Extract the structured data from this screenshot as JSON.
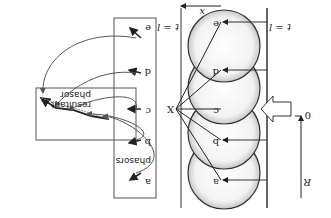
{
  "diagram": {
    "orientation": "rotated 180 degrees",
    "left_panel": {
      "zone_labels": [
        "a",
        "b",
        "c",
        "d",
        "e"
      ],
      "wall_label_top": "t = l",
      "wall_label_bottom": "t = l",
      "width_label": "x",
      "point_label": "X",
      "axis_label_zero": "0",
      "axis_label_end": "R"
    },
    "right_panel": {
      "phasors_box_label": "phasors",
      "phasor_labels": [
        "a",
        "b",
        "c",
        "d",
        "e"
      ],
      "resultant_box_label_1": "phasor",
      "resultant_box_label_2": "resultant"
    }
  }
}
